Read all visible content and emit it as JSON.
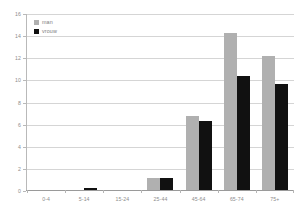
{
  "chart_data": {
    "type": "bar",
    "title": "",
    "subtitle": "",
    "xlabel": "",
    "ylabel": "",
    "categories": [
      "0-4",
      "5-14",
      "15-24",
      "25-44",
      "45-64",
      "65-74",
      "75+"
    ],
    "series": [
      {
        "name": "man",
        "color": "#b0b0b0",
        "values": [
          0,
          0,
          0,
          1.1,
          6.7,
          14.2,
          12.1
        ]
      },
      {
        "name": "vrouw",
        "color": "#111111",
        "values": [
          0,
          0.15,
          0,
          1.1,
          6.2,
          10.3,
          9.6
        ]
      }
    ],
    "ylim": [
      0,
      16
    ],
    "yticks": [
      0,
      2,
      4,
      6,
      8,
      10,
      12,
      14,
      16
    ],
    "ytick_labels": [
      "0",
      "2",
      "4",
      "6",
      "8",
      "10",
      "12",
      "14",
      "16"
    ],
    "grid": true,
    "legend_position": "top-left",
    "legend_entries": [
      "man",
      "vrouw"
    ],
    "annotations": []
  },
  "colors": {
    "background": "#ffffff",
    "gridline": "#d5d5d5",
    "axis": "#b9b9b9",
    "tick_text": "#8d8d8d",
    "legend_text": "#7d7d7d"
  }
}
